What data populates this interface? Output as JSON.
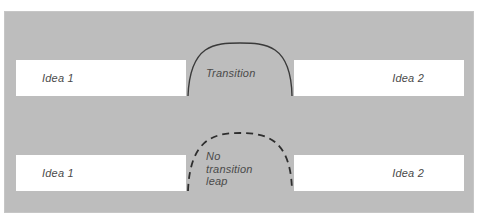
{
  "diagram": {
    "panel": {
      "background_color": "#bdbdbd"
    },
    "rows": [
      {
        "id": "with-transition",
        "left_box": {
          "label": "Idea 1"
        },
        "right_box": {
          "label": "Idea 2"
        },
        "connector": {
          "style": "solid",
          "label": "Transition",
          "color": "#3a3a3a"
        }
      },
      {
        "id": "without-transition",
        "left_box": {
          "label": "Idea 1"
        },
        "right_box": {
          "label": "Idea 2"
        },
        "connector": {
          "style": "dashed",
          "label": "No\ntransition\nleap",
          "color": "#2e2e2e"
        }
      }
    ],
    "colors": {
      "box_fill": "#ffffff",
      "text": "#4a4a4a",
      "arc_solid": "#3a3a3a",
      "arc_dashed": "#2e2e2e",
      "canvas": "#ffffff"
    }
  }
}
